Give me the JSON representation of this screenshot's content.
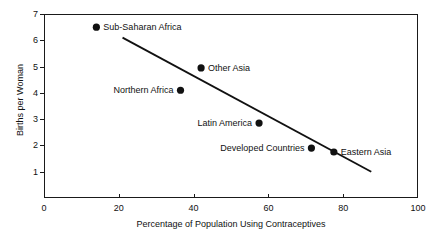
{
  "chart_data": {
    "type": "scatter",
    "title": "",
    "xlabel": "Percentage of Population Using Contraceptives",
    "ylabel": "Births per Woman",
    "xlim": [
      0,
      100
    ],
    "ylim": [
      0,
      7
    ],
    "xticks": [
      0,
      20,
      40,
      60,
      80,
      100
    ],
    "yticks": [
      1,
      2,
      3,
      4,
      5,
      6,
      7
    ],
    "grid": false,
    "legend": "none",
    "marker_color": "#111111",
    "line_color": "#111111",
    "points": [
      {
        "label": "Sub-Saharan Africa",
        "x": 14.0,
        "y": 6.5,
        "label_side": "right"
      },
      {
        "label": "Other Asia",
        "x": 42.0,
        "y": 4.95,
        "label_side": "right"
      },
      {
        "label": "Northern Africa",
        "x": 36.5,
        "y": 4.1,
        "label_side": "left"
      },
      {
        "label": "Latin America",
        "x": 57.5,
        "y": 2.85,
        "label_side": "left"
      },
      {
        "label": "Developed Countries",
        "x": 71.5,
        "y": 1.9,
        "label_side": "left"
      },
      {
        "label": "Eastern Asia",
        "x": 77.5,
        "y": 1.75,
        "label_side": "right"
      }
    ],
    "trend_line": {
      "x0": 21.0,
      "y0": 6.1,
      "x1": 87.5,
      "y1": 1.0
    }
  }
}
